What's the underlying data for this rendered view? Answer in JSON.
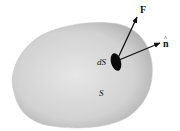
{
  "diagram": {
    "type": "surface-element-flux",
    "labels": {
      "force": "F",
      "normal": "n",
      "normal_hat": "^",
      "area_element": "dS",
      "surface": "S"
    },
    "colors": {
      "surface_center": "#e4e4e4",
      "surface_edge": "#b4b4b4",
      "area_element": "#0a0a0a",
      "arrows": "#111111"
    }
  }
}
